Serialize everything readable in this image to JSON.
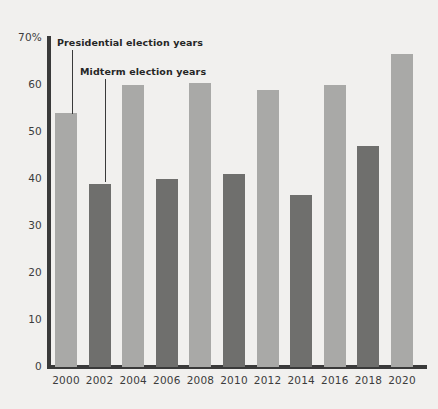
{
  "chart_data": {
    "type": "bar",
    "title": "",
    "subtitle": "",
    "xlabel": "",
    "ylabel": "",
    "categories": [
      "2000",
      "2002",
      "2004",
      "2006",
      "2008",
      "2010",
      "2012",
      "2014",
      "2016",
      "2018",
      "2020"
    ],
    "values": [
      54,
      39,
      60,
      40,
      60.5,
      41,
      59,
      36.5,
      60,
      47,
      66.5
    ],
    "point_types": [
      "presidential",
      "midterm",
      "presidential",
      "midterm",
      "presidential",
      "midterm",
      "presidential",
      "midterm",
      "presidential",
      "midterm",
      "presidential"
    ],
    "series": [
      {
        "name": "Presidential election years",
        "color": "#a9a9a7",
        "points": [
          {
            "x": "2000",
            "y": 54
          },
          {
            "x": "2004",
            "y": 60
          },
          {
            "x": "2008",
            "y": 60.5
          },
          {
            "x": "2012",
            "y": 59
          },
          {
            "x": "2016",
            "y": 60
          },
          {
            "x": "2020",
            "y": 66.5
          }
        ]
      },
      {
        "name": "Midterm election years",
        "color": "#6f6f6d",
        "points": [
          {
            "x": "2002",
            "y": 39
          },
          {
            "x": "2006",
            "y": 40
          },
          {
            "x": "2010",
            "y": 41
          },
          {
            "x": "2014",
            "y": 36.5
          },
          {
            "x": "2018",
            "y": 47
          }
        ]
      }
    ],
    "ylim": [
      0,
      70
    ],
    "ytick_values": [
      0,
      10,
      20,
      30,
      40,
      50,
      60,
      70
    ],
    "ytick_labels": [
      "0",
      "10",
      "20",
      "30",
      "40",
      "50",
      "60",
      "70%"
    ],
    "grid": false,
    "legend_position": "none",
    "annotations": [
      {
        "text": "Presidential election years",
        "target_category": "2000",
        "label_x": 57,
        "label_y": 37,
        "leader_x": 72,
        "leader_top": 50,
        "leader_bottom": 114
      },
      {
        "text": "Midterm election years",
        "target_category": "2002",
        "label_x": 80,
        "label_y": 66,
        "leader_x": 105,
        "leader_top": 79,
        "leader_bottom": 182
      }
    ]
  },
  "layout": {
    "background_color": "#f1f0ee",
    "axis_color": "#3a3a3a",
    "text_color": "#3c3c3c",
    "annotation_text_color": "#262626",
    "baseline_y": 367,
    "top_y": 38,
    "px_per_unit": 4.7,
    "first_bar_left": 55,
    "bar_width": 22,
    "bar_pitch": 33.6
  }
}
